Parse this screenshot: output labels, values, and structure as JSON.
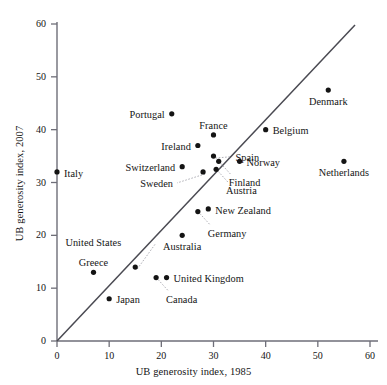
{
  "chart_data": {
    "type": "scatter",
    "title": "",
    "xlabel": "UB generosity index, 1985",
    "ylabel": "UB generosity index, 2007",
    "xlim": [
      0,
      62
    ],
    "ylim": [
      0,
      62
    ],
    "xticks": [
      0,
      10,
      20,
      30,
      40,
      50,
      60
    ],
    "yticks": [
      0,
      10,
      20,
      30,
      40,
      50,
      60
    ],
    "grid": false,
    "legend": "none",
    "annotations": [
      {
        "text": "45-degree reference line",
        "from": [
          0,
          0
        ],
        "to": [
          57,
          57
        ]
      }
    ],
    "points": [
      {
        "label": "Italy",
        "x": 0,
        "y": 32,
        "label_pos": "right"
      },
      {
        "label": "Portugal",
        "x": 22,
        "y": 43,
        "label_pos": "left"
      },
      {
        "label": "Ireland",
        "x": 27,
        "y": 37,
        "label_pos": "left"
      },
      {
        "label": "Switzerland",
        "x": 24,
        "y": 33,
        "label_pos": "left"
      },
      {
        "label": "France",
        "x": 30,
        "y": 39,
        "label_pos": "above"
      },
      {
        "label": "Spain",
        "x": 30,
        "y": 35,
        "label_pos": "leader-right"
      },
      {
        "label": "Norway",
        "x": 35,
        "y": 34,
        "label_pos": "right"
      },
      {
        "label": "Finland",
        "x": 31,
        "y": 34,
        "label_pos": "leader-below"
      },
      {
        "label": "Austria",
        "x": 30.5,
        "y": 32.5,
        "label_pos": "leader-below"
      },
      {
        "label": "Sweden",
        "x": 28,
        "y": 32,
        "label_pos": "leader-left"
      },
      {
        "label": "Belgium",
        "x": 40,
        "y": 40,
        "label_pos": "right"
      },
      {
        "label": "Denmark",
        "x": 52,
        "y": 47.5,
        "label_pos": "below"
      },
      {
        "label": "Netherlands",
        "x": 55,
        "y": 34,
        "label_pos": "below"
      },
      {
        "label": "New Zealand",
        "x": 29,
        "y": 25,
        "label_pos": "right"
      },
      {
        "label": "Germany",
        "x": 27,
        "y": 24.5,
        "label_pos": "leader-below"
      },
      {
        "label": "Australia",
        "x": 24,
        "y": 20,
        "label_pos": "below"
      },
      {
        "label": "United States",
        "x": 15,
        "y": 14,
        "label_pos": "leader-above"
      },
      {
        "label": "Greece",
        "x": 7,
        "y": 13,
        "label_pos": "above"
      },
      {
        "label": "Japan",
        "x": 10,
        "y": 8,
        "label_pos": "right"
      },
      {
        "label": "United Kingdom",
        "x": 21,
        "y": 12,
        "label_pos": "right"
      },
      {
        "label": "Canada",
        "x": 19,
        "y": 12,
        "label_pos": "leader-below"
      }
    ]
  },
  "axes": {
    "x_title": "UB generosity index, 1985",
    "y_title": "UB generosity index, 2007",
    "x_tick_labels": [
      "0",
      "10",
      "20",
      "30",
      "40",
      "50",
      "60"
    ],
    "y_tick_labels": [
      "0",
      "10",
      "20",
      "30",
      "40",
      "50",
      "60"
    ]
  },
  "labels": {
    "italy": "Italy",
    "portugal": "Portugal",
    "ireland": "Ireland",
    "switzerland": "Switzerland",
    "france": "France",
    "spain": "Spain",
    "norway": "Norway",
    "finland": "Finland",
    "austria": "Austria",
    "sweden": "Sweden",
    "belgium": "Belgium",
    "denmark": "Denmark",
    "netherlands": "Netherlands",
    "new_zealand": "New Zealand",
    "germany": "Germany",
    "australia": "Australia",
    "united_states": "United States",
    "greece": "Greece",
    "japan": "Japan",
    "united_kingdom": "United Kingdom",
    "canada": "Canada"
  },
  "colors": {
    "point": "#141414",
    "axis": "#6e6e78",
    "line": "#4a4a52",
    "leader": "#9a9aa2",
    "text": "#141414",
    "background": "#ffffff"
  }
}
